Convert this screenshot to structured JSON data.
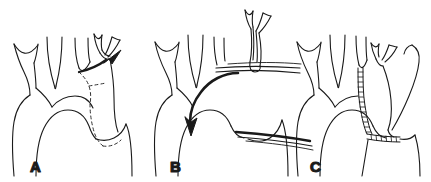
{
  "figure": {
    "title": "",
    "background_color": "#ffffff",
    "line_color": "#1a1a1a",
    "width": 431,
    "height": 182,
    "panel_count": 3
  },
  "panels": [
    {
      "id": "panel-a",
      "label": "A",
      "label_x": 30,
      "label_y": 172,
      "description": "Aortic arch with three supra-aortic branch vessels, aberrant vessel marked by dashed outline, solid curved arrow indicating direction",
      "elements": {
        "arch": "aortic-arch-outline",
        "branches": 3,
        "dashed_marker": "aberrant-vessel-dashed-line",
        "arrow": "curved-solid-arrow"
      }
    },
    {
      "id": "panel-b",
      "label": "B",
      "label_x": 170,
      "label_y": 172,
      "description": "Aortic arch with detached branch vessel displaced superiorly, thick curved arrow into arch, catheter lines entering from right",
      "elements": {
        "arch": "aortic-arch-outline",
        "branches": 2,
        "detached_graft": "mobilized-vessel-segment",
        "arrow": "thick-curved-arrow",
        "catheters": 2
      }
    },
    {
      "id": "panel-c",
      "label": "C",
      "label_x": 310,
      "label_y": 172,
      "description": "Aortic arch with stent graft shown as ladder/beaded hatched conduit running from branch vessel to descending aorta, plus curved bypass loop",
      "elements": {
        "arch": "aortic-arch-outline",
        "branches": 3,
        "stent_graft": "ladder-hatched-stent",
        "bypass_loop": "curved-conduit-loop"
      }
    }
  ]
}
